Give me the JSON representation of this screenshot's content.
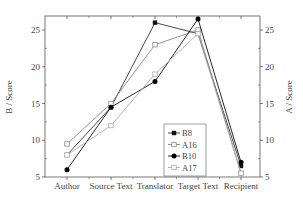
{
  "chart_data": {
    "type": "line",
    "title": "",
    "xlabel": "",
    "ylabel_left": "B / Score",
    "ylabel_right": "A / Score",
    "categories": [
      "Author",
      "Source Text",
      "Translator",
      "Target Text",
      "Recipient"
    ],
    "ylim": [
      5,
      27
    ],
    "yticks": [
      5,
      10,
      15,
      20,
      25
    ],
    "grid": false,
    "legend_position": "inside lower right",
    "series": [
      {
        "name": "B8",
        "marker": "filled-square",
        "color": "#333333",
        "axis": "left",
        "values": [
          8,
          14.5,
          26,
          24.5,
          6.5
        ]
      },
      {
        "name": "A16",
        "marker": "open-square",
        "color": "#888888",
        "axis": "right",
        "values": [
          9.5,
          15,
          23,
          25,
          5.5
        ]
      },
      {
        "name": "B10",
        "marker": "filled-circle",
        "color": "#111111",
        "axis": "left",
        "values": [
          6,
          14.5,
          18,
          26.5,
          7
        ]
      },
      {
        "name": "A17",
        "marker": "open-square",
        "color": "#aaaaaa",
        "axis": "right",
        "values": [
          8,
          12,
          19,
          24.5,
          5.5
        ]
      }
    ]
  }
}
